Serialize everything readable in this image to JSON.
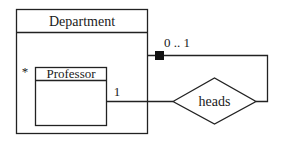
{
  "diagram": {
    "type": "UML class diagram (composite structure with association)",
    "colors": {
      "line": "#222222",
      "background": "#ffffff",
      "fill_marker": "#111111"
    },
    "classes": [
      {
        "id": "department",
        "name": "Department"
      },
      {
        "id": "professor",
        "name": "Professor",
        "multiplicity": "*"
      }
    ],
    "association": {
      "name": "heads",
      "shape": "diamond",
      "ends": [
        {
          "class": "professor",
          "multiplicity": "1"
        },
        {
          "class": "department",
          "multiplicity": "0 .. 1",
          "marker": "filled-square"
        }
      ]
    }
  }
}
